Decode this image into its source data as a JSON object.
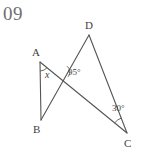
{
  "figure": {
    "problem_number": "09",
    "type": "geometry-diagram",
    "stroke_color": "#555555",
    "text_color": "#3f3f3f",
    "number_color": "#6f6f6f",
    "background_color": "#ffffff",
    "vertices": [
      {
        "name": "D",
        "label": "D",
        "x": 89,
        "y": 35,
        "label_x": 85,
        "label_y": 20
      },
      {
        "name": "A",
        "label": "A",
        "x": 40,
        "y": 62,
        "label_x": 32,
        "label_y": 47
      },
      {
        "name": "B",
        "label": "B",
        "x": 41,
        "y": 120,
        "label_x": 33,
        "label_y": 124
      },
      {
        "name": "C",
        "label": "C",
        "x": 127,
        "y": 133,
        "label_x": 124,
        "label_y": 138
      }
    ],
    "segments": [
      {
        "name": "segment-AB",
        "from": "A",
        "to": "B"
      },
      {
        "name": "segment-AC",
        "from": "A",
        "to": "C"
      },
      {
        "name": "segment-BD",
        "from": "B",
        "to": "D"
      },
      {
        "name": "segment-DC",
        "from": "D",
        "to": "C"
      }
    ],
    "intersection": {
      "name": "intersection-point",
      "x": 63,
      "y": 72
    },
    "angles": [
      {
        "name": "angle-at-A",
        "label": "x",
        "italic": true,
        "label_x": 45,
        "label_y": 70,
        "vertex": "A"
      },
      {
        "name": "angle-at-intersection",
        "label": "95°",
        "italic": false,
        "label_x": 68,
        "label_y": 68,
        "vertex": "intersection-point"
      },
      {
        "name": "angle-at-C",
        "label": "30°",
        "italic": false,
        "label_x": 112,
        "label_y": 104,
        "vertex": "C"
      }
    ]
  }
}
